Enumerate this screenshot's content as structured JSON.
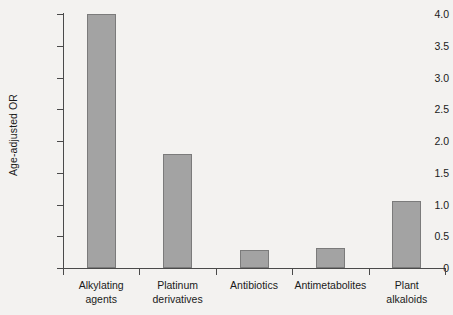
{
  "chart_data": {
    "type": "bar",
    "title": "",
    "xlabel": "",
    "ylabel": "Age-adjusted OR",
    "categories": [
      "Alkylating agents",
      "Platinum derivatives",
      "Antibiotics",
      "Antimetabolites",
      "Plant alkaloids"
    ],
    "category_lines": [
      [
        "Alkylating",
        "agents"
      ],
      [
        "Platinum",
        "derivatives"
      ],
      [
        "Antibiotics"
      ],
      [
        "Antimetabolites"
      ],
      [
        "Plant",
        "alkaloids"
      ]
    ],
    "values": [
      4.0,
      1.8,
      0.28,
      0.31,
      1.05
    ],
    "ylim": [
      0,
      4.0
    ],
    "ytick_values": [
      0,
      0.5,
      1.0,
      1.5,
      2.0,
      2.5,
      3.0,
      3.5,
      4.0
    ],
    "ytick_labels": [
      "0",
      "0.5",
      "1.0",
      "1.5",
      "2.0",
      "2.5",
      "3.0",
      "3.5",
      "4.0"
    ],
    "grid": false,
    "legend": "none",
    "bar_color": "#a3a3a3",
    "bar_edge_color": "#7b7b7b",
    "axis_color": "#4a4a4a",
    "background_color": "#f3f2f0"
  }
}
